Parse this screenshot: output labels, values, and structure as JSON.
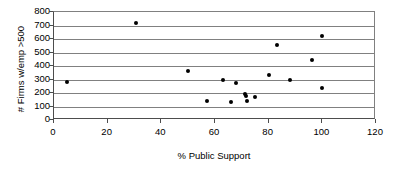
{
  "chart_data": {
    "type": "scatter",
    "title": "",
    "xlabel": "% Public Support",
    "ylabel": "# Firms w/emp >500",
    "xlim": [
      0,
      120
    ],
    "ylim": [
      0,
      800
    ],
    "xticks": [
      0,
      20,
      40,
      60,
      80,
      100,
      120
    ],
    "yticks": [
      0,
      100,
      200,
      300,
      400,
      500,
      600,
      700,
      800
    ],
    "xtick_labels": [
      "0",
      "20",
      "40",
      "60",
      "80",
      "100",
      "120"
    ],
    "ytick_labels": [
      "0",
      "100",
      "200",
      "300",
      "400",
      "500",
      "600",
      "700",
      "800"
    ],
    "grid": "horizontal",
    "legend": "none",
    "marker": "filled-circle",
    "marker_color": "#000000",
    "gridline_color": "#808080",
    "axis_color": "#4d4d4d",
    "background_color": "#ffffff",
    "series": [
      {
        "name": "Firms",
        "points": [
          {
            "x": 5,
            "y": 280
          },
          {
            "x": 30.5,
            "y": 715
          },
          {
            "x": 50,
            "y": 365
          },
          {
            "x": 57,
            "y": 140
          },
          {
            "x": 63,
            "y": 300
          },
          {
            "x": 66,
            "y": 130
          },
          {
            "x": 68,
            "y": 272
          },
          {
            "x": 71,
            "y": 195
          },
          {
            "x": 71.5,
            "y": 178
          },
          {
            "x": 72,
            "y": 142
          },
          {
            "x": 75,
            "y": 168
          },
          {
            "x": 80,
            "y": 330
          },
          {
            "x": 83,
            "y": 558
          },
          {
            "x": 88,
            "y": 300
          },
          {
            "x": 96,
            "y": 447
          },
          {
            "x": 100,
            "y": 620
          },
          {
            "x": 100,
            "y": 237
          }
        ]
      }
    ]
  }
}
